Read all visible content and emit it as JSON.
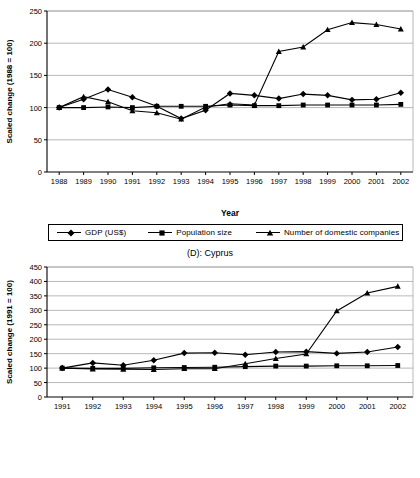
{
  "figures": [
    {
      "id": "top",
      "title": "",
      "xlabel": "Year",
      "ylabel": "Scaled change (1988 = 100)",
      "legend": [
        {
          "label": "GDP (US$)",
          "marker": "diamond"
        },
        {
          "label": "Population size",
          "marker": "square"
        },
        {
          "label": "Number of domestic companies",
          "marker": "triangle"
        }
      ]
    },
    {
      "id": "bottom",
      "title": "(D): Cyprus",
      "xlabel": "Year",
      "ylabel": "Scaled change (1991 = 100)",
      "legend": [
        {
          "label": "GDP (US$)",
          "marker": "diamond"
        },
        {
          "label": "Population size",
          "marker": "square"
        },
        {
          "label": "Number of domestic companies",
          "marker": "triangle"
        }
      ]
    }
  ],
  "chart_data": [
    {
      "type": "line",
      "id": "top",
      "title": "",
      "xlabel": "Year",
      "ylabel": "Scaled change (1988 = 100)",
      "categories": [
        "1988",
        "1989",
        "1990",
        "1991",
        "1992",
        "1993",
        "1994",
        "1995",
        "1996",
        "1997",
        "1998",
        "1999",
        "2000",
        "2001",
        "2002"
      ],
      "ylim": [
        0,
        250
      ],
      "yticks": [
        0,
        50,
        100,
        150,
        200,
        250
      ],
      "grid": true,
      "legend_position": "below",
      "series": [
        {
          "name": "GDP (US$)",
          "marker": "diamond",
          "values": [
            100,
            113,
            128,
            116,
            102,
            83,
            96,
            122,
            119,
            114,
            121,
            119,
            112,
            113,
            123
          ]
        },
        {
          "name": "Population size",
          "marker": "square",
          "values": [
            100,
            100,
            101,
            100,
            102,
            102,
            102,
            104,
            103,
            103,
            104,
            104,
            104,
            104,
            105
          ]
        },
        {
          "name": "Number of domestic companies",
          "marker": "triangle",
          "values": [
            100,
            117,
            109,
            95,
            92,
            82,
            101,
            106,
            104,
            187,
            194,
            221,
            232,
            229,
            222
          ]
        }
      ]
    },
    {
      "type": "line",
      "id": "bottom",
      "title": "(D): Cyprus",
      "xlabel": "Year",
      "ylabel": "Scaled change (1991 = 100)",
      "categories": [
        "1991",
        "1992",
        "1993",
        "1994",
        "1995",
        "1996",
        "1997",
        "1998",
        "1999",
        "2000",
        "2001",
        "2002"
      ],
      "ylim": [
        0,
        450
      ],
      "yticks": [
        0,
        50,
        100,
        150,
        200,
        250,
        300,
        350,
        400,
        450
      ],
      "grid": true,
      "legend_position": "below",
      "series": [
        {
          "name": "GDP (US$)",
          "marker": "diamond",
          "values": [
            100,
            118,
            110,
            127,
            152,
            153,
            146,
            156,
            157,
            151,
            156,
            173
          ]
        },
        {
          "name": "Population size",
          "marker": "square",
          "values": [
            100,
            99,
            99,
            101,
            102,
            103,
            105,
            107,
            107,
            108,
            108,
            109
          ]
        },
        {
          "name": "Number of domestic companies",
          "marker": "triangle",
          "values": [
            100,
            97,
            96,
            95,
            98,
            98,
            115,
            133,
            149,
            298,
            360,
            383
          ]
        }
      ]
    }
  ],
  "colors": {
    "series": "#000000",
    "grid": "#a6a6a6",
    "axis": "#000000",
    "background": "#ffffff"
  }
}
